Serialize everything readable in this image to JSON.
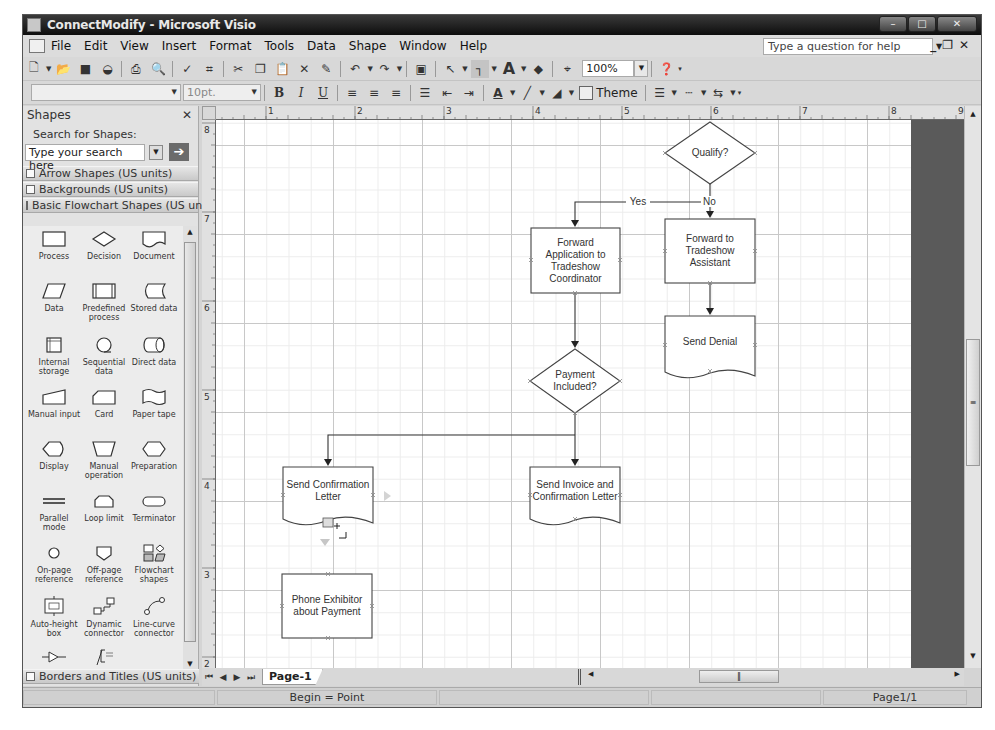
{
  "window": {
    "title": "ConnectModify - Microsoft Visio",
    "controls": [
      "minimize",
      "maximize",
      "close"
    ]
  },
  "menubar": {
    "items": [
      {
        "label": "File",
        "accel": "F"
      },
      {
        "label": "Edit",
        "accel": "E"
      },
      {
        "label": "View",
        "accel": "V"
      },
      {
        "label": "Insert",
        "accel": "I"
      },
      {
        "label": "Format",
        "accel": "o"
      },
      {
        "label": "Tools",
        "accel": "T"
      },
      {
        "label": "Data",
        "accel": "D"
      },
      {
        "label": "Shape",
        "accel": "S"
      },
      {
        "label": "Window",
        "accel": "W"
      },
      {
        "label": "Help",
        "accel": "H"
      }
    ],
    "help_placeholder": "Type a question for help"
  },
  "standard_toolbar": {
    "zoom_value": "100%",
    "buttons": [
      "new",
      "open",
      "save",
      "permission",
      "print",
      "print-preview",
      "spelling",
      "research",
      "cut",
      "copy",
      "paste",
      "delete",
      "format-painter",
      "undo",
      "redo",
      "shapes",
      "pointer-tool",
      "connector-tool",
      "text-tool",
      "stamp-tool",
      "connection-point",
      "help"
    ]
  },
  "formatting_toolbar": {
    "font_value": "",
    "size_value": "10pt.",
    "theme_label": "Theme",
    "buttons": [
      "bold",
      "italic",
      "underline",
      "align-left",
      "align-center",
      "align-right",
      "bullets",
      "decrease-indent",
      "increase-indent",
      "font-color",
      "line-color",
      "fill-color",
      "line-weight",
      "line-pattern",
      "line-ends"
    ]
  },
  "shapes_panel": {
    "title": "Shapes",
    "search_label": "Search for Shapes:",
    "search_value": "Type your search here",
    "stencils_top": [
      "Arrow Shapes (US units)",
      "Backgrounds (US units)",
      "Basic Flowchart Shapes (US units)"
    ],
    "stencils_bottom": [
      "Borders and Titles (US units)"
    ],
    "shapes": [
      {
        "label": "Process"
      },
      {
        "label": "Decision"
      },
      {
        "label": "Document"
      },
      {
        "label": "Data"
      },
      {
        "label": "Predefined process"
      },
      {
        "label": "Stored data"
      },
      {
        "label": "Internal storage"
      },
      {
        "label": "Sequential data"
      },
      {
        "label": "Direct data"
      },
      {
        "label": "Manual input"
      },
      {
        "label": "Card"
      },
      {
        "label": "Paper tape"
      },
      {
        "label": "Display"
      },
      {
        "label": "Manual operation"
      },
      {
        "label": "Preparation"
      },
      {
        "label": "Parallel mode"
      },
      {
        "label": "Loop limit"
      },
      {
        "label": "Terminator"
      },
      {
        "label": "On-page reference"
      },
      {
        "label": "Off-page reference"
      },
      {
        "label": "Flowchart shapes"
      },
      {
        "label": "Auto-height box"
      },
      {
        "label": "Dynamic connector"
      },
      {
        "label": "Line-curve connector"
      },
      {
        "label": ""
      },
      {
        "label": ""
      }
    ]
  },
  "rulers": {
    "horizontal": [
      "1",
      "2",
      "3",
      "4",
      "5",
      "6",
      "7",
      "8",
      "9"
    ],
    "vertical": [
      "8",
      "7",
      "6",
      "5",
      "4",
      "3",
      "2"
    ]
  },
  "diagram": {
    "shapes": {
      "qualify": "Qualify?",
      "forward_coordinator": "Forward Application to Tradeshow Coordinator",
      "forward_assistant": "Forward to Tradeshow Assistant",
      "send_denial": "Send Denial",
      "payment_included": "Payment Included?",
      "send_confirmation": "Send Confirmation Letter",
      "send_invoice": "Send Invoice and Confirmation Letter",
      "phone_exhibitor": "Phone Exhibitor about Payment"
    },
    "connector_labels": {
      "yes": "Yes",
      "no": "No"
    }
  },
  "page_tabs": {
    "tabs": [
      "Page-1"
    ]
  },
  "statusbar": {
    "info": "Begin = Point",
    "page": "Page1/1"
  }
}
